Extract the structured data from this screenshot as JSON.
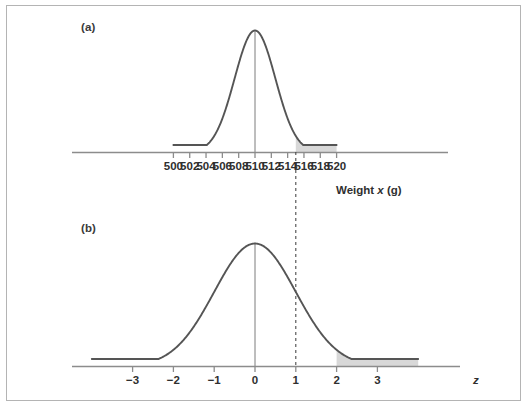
{
  "figure": {
    "panel_a_tag": "(a)",
    "panel_b_tag": "(b)",
    "border_color": "#b4b4b4",
    "curve_color": "#555555",
    "shade_color": "#d8d8d8",
    "axis_color": "#8c8c8c",
    "text_color": "#2f2f2f"
  },
  "chart_data": [
    {
      "type": "line",
      "id": "panel-a",
      "title": "(a)",
      "subtitle": "",
      "xlabel": "Weight x (g)",
      "xlabel_plain": "Weight",
      "xlabel_italic_var": "x",
      "xlabel_unit": "(g)",
      "ylabel": "",
      "distribution": "normal",
      "mean": 510,
      "sd": 2.5,
      "xlim": [
        499,
        521.5
      ],
      "tick_labels": [
        "500",
        "502",
        "504",
        "506",
        "508",
        "510",
        "512",
        "514",
        "516",
        "518",
        "520"
      ],
      "tick_values": [
        500,
        502,
        504,
        506,
        508,
        510,
        512,
        514,
        516,
        518,
        520
      ],
      "grid": false,
      "legend": "none",
      "center_line_at": 510,
      "shaded_region": {
        "from": 515,
        "to": 520,
        "fill": "#d8d8d8",
        "description": "upper tail beyond 515"
      },
      "curve_x_range": [
        500,
        520
      ],
      "annotations": [
        {
          "text": "dashed connector at x = 515 linking panel (a) to panel (b) z = 2",
          "x": 515
        }
      ]
    },
    {
      "type": "line",
      "id": "panel-b",
      "title": "(b)",
      "subtitle": "",
      "xlabel": "z",
      "xlabel_italic_var": "z",
      "ylabel": "",
      "distribution": "standard normal",
      "mean": 0,
      "sd": 1,
      "xlim": [
        -4.1,
        4.4
      ],
      "tick_labels": [
        "−3",
        "−2",
        "−1",
        "0",
        "1",
        "2",
        "3"
      ],
      "tick_values": [
        -3,
        -2,
        -1,
        0,
        1,
        2,
        3
      ],
      "grid": false,
      "legend": "none",
      "center_line_at": 0,
      "shaded_region": {
        "from": 2,
        "to": 4,
        "fill": "#d8d8d8",
        "description": "upper tail beyond z = 2"
      },
      "curve_x_range": [
        -4,
        4
      ],
      "annotations": [
        {
          "text": "dashed connector at z = 2 linking to panel (a) x = 515",
          "x": 2
        }
      ]
    }
  ]
}
